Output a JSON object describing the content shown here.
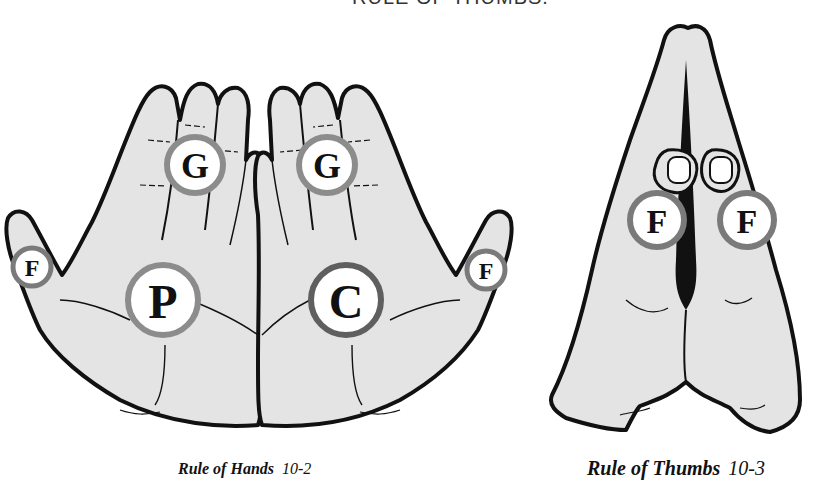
{
  "heading": {
    "text": "RULE OF THUMBS."
  },
  "figures": [
    {
      "id": "rule-of-hands",
      "caption_title": "Rule of Hands",
      "caption_number": "10-2",
      "labels": {
        "left_finger": "G",
        "right_finger": "G",
        "left_thumb": "F",
        "right_thumb": "F",
        "left_palm": "P",
        "right_palm": "C"
      }
    },
    {
      "id": "rule-of-thumbs",
      "caption_title": "Rule of Thumbs",
      "caption_number": "10-3",
      "labels": {
        "left_thumb": "F",
        "right_thumb": "F"
      }
    }
  ],
  "colors": {
    "skin": "#e4e4e4",
    "outline": "#111111",
    "ring": "#8c8c8c",
    "ring_dark": "#5f5f5f",
    "badge_fill": "#ffffff"
  }
}
